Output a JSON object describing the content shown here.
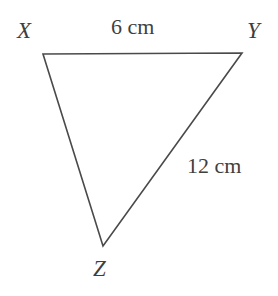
{
  "figure": {
    "kind": "geometry-diagram",
    "shape": "triangle",
    "background_color": "#ffffff",
    "stroke_color": "#4a4a4a",
    "text_color": "#3f3f3f",
    "stroke_width": 1.6,
    "width": 278,
    "height": 296,
    "vertices": [
      {
        "name": "X",
        "label": "X",
        "x": 43,
        "y": 54
      },
      {
        "name": "Y",
        "label": "Y",
        "x": 242,
        "y": 53
      },
      {
        "name": "Z",
        "label": "Z",
        "x": 103,
        "y": 246
      }
    ],
    "polygon_points": "43,54 242,53 103,246",
    "sides": [
      {
        "name": "XY",
        "from": "X",
        "to": "Y",
        "label": "6 cm",
        "length": 6,
        "unit": "cm"
      },
      {
        "name": "YZ",
        "from": "Y",
        "to": "Z",
        "label": "12 cm",
        "length": 12,
        "unit": "cm"
      },
      {
        "name": "ZX",
        "from": "Z",
        "to": "X",
        "label": "",
        "length": null,
        "unit": ""
      }
    ]
  }
}
